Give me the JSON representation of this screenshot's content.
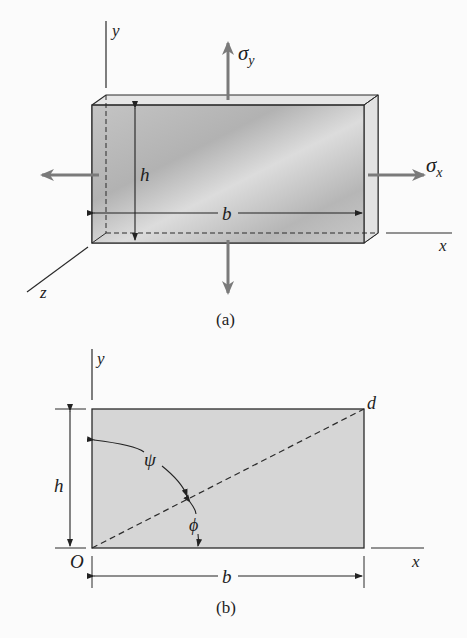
{
  "figure_a": {
    "caption": "(a)",
    "axis_y": "y",
    "axis_x": "x",
    "axis_z": "z",
    "stress_y": "σ",
    "stress_y_sub": "y",
    "stress_x": "σ",
    "stress_x_sub": "x",
    "dim_height": "h",
    "dim_width": "b"
  },
  "figure_b": {
    "caption": "(b)",
    "axis_y": "y",
    "axis_x": "x",
    "origin": "O",
    "corner": "d",
    "dim_height": "h",
    "dim_width": "b",
    "angle_psi": "ψ",
    "angle_phi": "ϕ"
  },
  "colors": {
    "line": "#2a2a2a",
    "arrow_gray": "#7a7a7a",
    "plate_fill": "#d2d2d2",
    "plate_face": "#bdbdbd",
    "rect_fill": "#d6d6d6"
  }
}
